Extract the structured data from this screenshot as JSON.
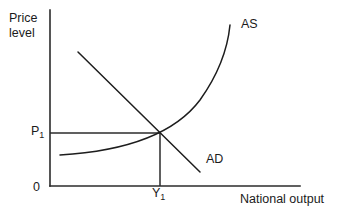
{
  "diagram": {
    "axes": {
      "y_label_line1": "Price",
      "y_label_line2": "level",
      "x_label": "National output",
      "origin_label": "0"
    },
    "markers": {
      "price_symbol": "P",
      "price_subscript": "1",
      "output_symbol": "Y",
      "output_subscript": "1"
    },
    "curves": [
      {
        "name": "aggregate-supply",
        "label": "AS",
        "shape": "upward-sloping-convex",
        "path": "M 60 155 C 110 152, 170 140, 200 100 C 220 72, 228 45, 230 25"
      },
      {
        "name": "aggregate-demand",
        "label": "AD",
        "shape": "downward-sloping-straight",
        "path": "M 78 52 L 200 172"
      }
    ],
    "guides": [
      {
        "name": "price-guide",
        "orientation": "horizontal",
        "path": "M 50 133 L 160 133"
      },
      {
        "name": "output-guide",
        "orientation": "vertical",
        "path": "M 160 133 L 160 186"
      }
    ],
    "equilibrium": {
      "x": 160,
      "y": 133
    },
    "colors": {
      "ink": "#1d1d1d",
      "axis": "#2b2b2b",
      "background": "#ffffff"
    }
  }
}
